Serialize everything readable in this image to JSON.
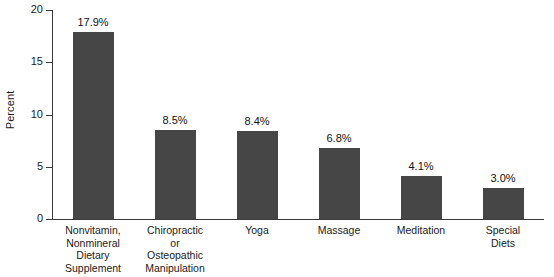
{
  "chart_data": {
    "type": "bar",
    "title": "",
    "xlabel": "",
    "ylabel": "Percent",
    "ylim": [
      0,
      20
    ],
    "yticks": [
      0,
      5,
      10,
      15,
      20
    ],
    "ytick_labels": [
      "0",
      "5",
      "10",
      "15",
      "20"
    ],
    "grid": false,
    "legend": null,
    "categories": [
      "Nonvitamin, Nonmineral Dietary Supplement",
      "Chiropractic or Osteopathic Manipulation",
      "Yoga",
      "Massage",
      "Meditation",
      "Special Diets"
    ],
    "category_lines": [
      [
        "Nonvitamin,",
        "Nonmineral",
        "Dietary",
        "Supplement"
      ],
      [
        "Chiropractic",
        "or",
        "Osteopathic",
        "Manipulation"
      ],
      [
        "Yoga"
      ],
      [
        "Massage"
      ],
      [
        "Meditation"
      ],
      [
        "Special",
        "Diets"
      ]
    ],
    "values": [
      17.9,
      8.5,
      8.4,
      6.8,
      4.1,
      3.0
    ],
    "data_labels": [
      "17.9%",
      "8.5%",
      "8.4%",
      "6.8%",
      "4.1%",
      "3.0%"
    ],
    "bar_color": "#464646",
    "axis_color": "#3a3a3a",
    "text_color": "#1a1a1a"
  }
}
